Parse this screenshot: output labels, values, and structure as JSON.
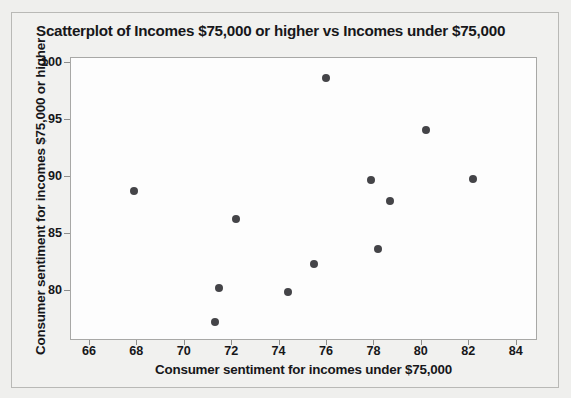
{
  "chart_data": {
    "type": "scatter",
    "title": "Scatterplot of Incomes $75,000 or higher vs Incomes under $75,000",
    "xlabel": "Consumer sentiment for incomes under $75,000",
    "ylabel": "Consumer sentiment for incomes $75,000 or higher",
    "xlim": [
      65.2,
      84.9
    ],
    "ylim": [
      75.6,
      100.4
    ],
    "xticks": [
      66,
      68,
      70,
      72,
      74,
      76,
      78,
      80,
      82,
      84
    ],
    "yticks": [
      80,
      85,
      90,
      95,
      100
    ],
    "grid": false,
    "legend": null,
    "marker_color": "#444448",
    "points": [
      {
        "x": 67.9,
        "y": 88.7
      },
      {
        "x": 71.3,
        "y": 77.2
      },
      {
        "x": 71.5,
        "y": 80.2
      },
      {
        "x": 72.2,
        "y": 86.2
      },
      {
        "x": 74.4,
        "y": 79.8
      },
      {
        "x": 75.5,
        "y": 82.3
      },
      {
        "x": 76.0,
        "y": 98.6
      },
      {
        "x": 77.9,
        "y": 89.6
      },
      {
        "x": 78.2,
        "y": 83.6
      },
      {
        "x": 78.7,
        "y": 87.8
      },
      {
        "x": 80.2,
        "y": 94.0
      },
      {
        "x": 82.2,
        "y": 89.7
      }
    ],
    "series": [
      {
        "name": "Consumer sentiment",
        "x": [
          67.9,
          71.3,
          71.5,
          72.2,
          74.4,
          75.5,
          76.0,
          77.9,
          78.2,
          78.7,
          80.2,
          82.2
        ],
        "values": [
          88.7,
          77.2,
          80.2,
          86.2,
          79.8,
          82.3,
          98.6,
          89.6,
          83.6,
          87.8,
          94.0,
          89.7
        ]
      }
    ]
  }
}
